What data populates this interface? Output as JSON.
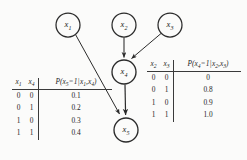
{
  "figure": {
    "type": "bayesian-network-diagram",
    "background_color": "#fbfbfa",
    "stroke_color": "#2b2b2b"
  },
  "graph": {
    "nodes": [
      {
        "id": "x1",
        "label": "x",
        "subscript": "1",
        "cx": 68,
        "cy": 25,
        "r": 12
      },
      {
        "id": "x2",
        "label": "x",
        "subscript": "2",
        "cx": 124,
        "cy": 25,
        "r": 12
      },
      {
        "id": "x3",
        "label": "x",
        "subscript": "3",
        "cx": 170,
        "cy": 25,
        "r": 12
      },
      {
        "id": "x4",
        "label": "x",
        "subscript": "4",
        "cx": 124,
        "cy": 72,
        "r": 12
      },
      {
        "id": "x5",
        "label": "x",
        "subscript": "5",
        "cx": 126,
        "cy": 130,
        "r": 12
      }
    ],
    "edges": [
      {
        "id": "e-x2-x4",
        "from": "x2",
        "to": "x4"
      },
      {
        "id": "e-x3-x4",
        "from": "x3",
        "to": "x4"
      },
      {
        "id": "e-x4-x5",
        "from": "x4",
        "to": "x5"
      },
      {
        "id": "e-x1-x5",
        "from": "x1",
        "to": "x5"
      }
    ]
  },
  "tables": {
    "left": {
      "id": "cpt-x5",
      "headers": {
        "var1": "x",
        "var1_sub": "1",
        "var2": "x",
        "var2_sub": "4",
        "prob_prefix": "P(",
        "prob_var": "x",
        "prob_var_sub": "5",
        "prob_eq": "=",
        "prob_value": "1",
        "prob_bar": "|",
        "prob_cond1": "x",
        "prob_cond1_sub": "1",
        "prob_comma": ",",
        "prob_cond2": "x",
        "prob_cond2_sub": "4",
        "prob_suffix": ")"
      },
      "rows": [
        {
          "var1": "0",
          "var2": "0",
          "prob": "0.1"
        },
        {
          "var1": "0",
          "var2": "1",
          "prob": "0.2"
        },
        {
          "var1": "1",
          "var2": "0",
          "prob": "0.3"
        },
        {
          "var1": "1",
          "var2": "1",
          "prob": "0.4"
        }
      ]
    },
    "right": {
      "id": "cpt-x4",
      "headers": {
        "var1": "x",
        "var1_sub": "2",
        "var2": "x",
        "var2_sub": "3",
        "prob_prefix": "P(",
        "prob_var": "x",
        "prob_var_sub": "4",
        "prob_eq": "=",
        "prob_value": "1",
        "prob_bar": "|",
        "prob_cond1": "x",
        "prob_cond1_sub": "2",
        "prob_comma": ",",
        "prob_cond2": "x",
        "prob_cond2_sub": "3",
        "prob_suffix": ")"
      },
      "rows": [
        {
          "var1": "0",
          "var2": "0",
          "prob": "0"
        },
        {
          "var1": "0",
          "var2": "1",
          "prob": "0.8"
        },
        {
          "var1": "1",
          "var2": "0",
          "prob": "0.9"
        },
        {
          "var1": "1",
          "var2": "1",
          "prob": "1.0"
        }
      ]
    }
  }
}
